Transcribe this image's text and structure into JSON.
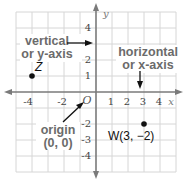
{
  "diagram": {
    "type": "coordinate-plane",
    "x_range": [
      -5,
      5
    ],
    "y_range": [
      -5,
      5
    ],
    "x_ticks": [
      "-4",
      "-2",
      "1",
      "2",
      "3",
      "4"
    ],
    "y_ticks": [
      "4",
      "2",
      "1",
      "-2",
      "-3",
      "-4"
    ],
    "x_axis_name": "x",
    "y_axis_name": "y",
    "origin_symbol": "O",
    "callouts": {
      "vertical_line1": "vertical",
      "vertical_line2": "or y-axis",
      "horizontal_line1": "horizontal",
      "horizontal_line2": "or x-axis",
      "origin_line1": "origin",
      "origin_line2": "(0, 0)"
    },
    "points": [
      {
        "name": "Z",
        "label": "Z",
        "x": -4,
        "y": 1
      },
      {
        "name": "W",
        "label": "W(3, −2)",
        "x": 3,
        "y": -2
      }
    ],
    "colors": {
      "grid": "#d6d6d6",
      "axis": "#7a7a7a",
      "callout_text": "#6b6b6b",
      "point": "#111111"
    }
  }
}
